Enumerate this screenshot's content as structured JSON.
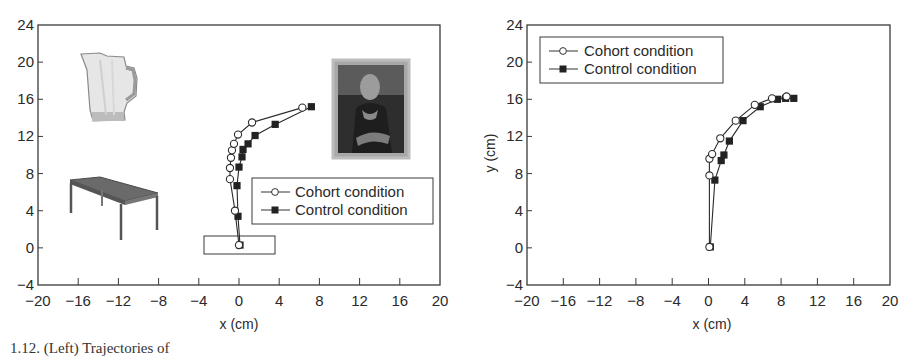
{
  "chart_data": [
    {
      "type": "line",
      "panel": "left",
      "title": "",
      "xlabel": "x (cm)",
      "ylabel": "",
      "xlim": [
        -20,
        20
      ],
      "ylim": [
        -4,
        24
      ],
      "xticks": [
        -20,
        -16,
        -12,
        -8,
        -4,
        0,
        4,
        8,
        12,
        16,
        20
      ],
      "yticks": [
        -4,
        0,
        4,
        8,
        12,
        16,
        20,
        24
      ],
      "grid": false,
      "legend_position": "center-right",
      "series": [
        {
          "name": "Cohort condition",
          "marker": "open-circle",
          "x": [
            0.0,
            -0.4,
            -0.9,
            -0.9,
            -0.8,
            -0.7,
            -0.5,
            -0.1,
            1.3,
            6.3
          ],
          "y": [
            0.3,
            4.0,
            7.4,
            8.6,
            9.7,
            10.5,
            11.2,
            12.2,
            13.5,
            15.1
          ]
        },
        {
          "name": "Control condition",
          "marker": "filled-square",
          "x": [
            0.1,
            -0.1,
            -0.2,
            0.0,
            0.3,
            0.4,
            0.9,
            1.6,
            3.6,
            7.2
          ],
          "y": [
            0.3,
            3.4,
            6.7,
            8.7,
            9.8,
            10.6,
            11.2,
            12.1,
            13.3,
            15.2
          ]
        }
      ],
      "annotations": [
        {
          "type": "image",
          "label": "pitcher",
          "x": -13,
          "y": 17
        },
        {
          "type": "image",
          "label": "table",
          "x": -13,
          "y": 5
        },
        {
          "type": "image",
          "label": "painting (Mona Lisa)",
          "x": 13.5,
          "y": 15
        },
        {
          "type": "rectangle",
          "label": "start box",
          "x_range": [
            -3.5,
            3.5
          ],
          "y_range": [
            -1.5,
            1.3
          ]
        }
      ]
    },
    {
      "type": "line",
      "panel": "right",
      "title": "",
      "xlabel": "x (cm)",
      "ylabel": "y (cm)",
      "xlim": [
        -20,
        20
      ],
      "ylim": [
        -4,
        24
      ],
      "xticks": [
        -20,
        -16,
        -12,
        -8,
        -4,
        0,
        4,
        8,
        12,
        16,
        20
      ],
      "yticks": [
        -4,
        0,
        4,
        8,
        12,
        16,
        20,
        24
      ],
      "grid": false,
      "legend_position": "top-left",
      "series": [
        {
          "name": "Cohort condition",
          "marker": "open-circle",
          "x": [
            0.1,
            0.1,
            0.1,
            0.4,
            1.3,
            3.0,
            5.1,
            7.0,
            8.6
          ],
          "y": [
            0.1,
            7.8,
            9.6,
            10.1,
            11.8,
            13.7,
            15.4,
            16.1,
            16.3
          ]
        },
        {
          "name": "Control condition",
          "marker": "filled-square",
          "x": [
            0.2,
            0.7,
            1.4,
            1.7,
            2.3,
            3.8,
            5.7,
            7.6,
            8.5,
            9.4
          ],
          "y": [
            0.1,
            7.3,
            9.4,
            10.0,
            11.5,
            13.7,
            15.2,
            16.0,
            16.1,
            16.1
          ]
        }
      ]
    }
  ],
  "caption": "1.12. (Left) Trajectories of"
}
